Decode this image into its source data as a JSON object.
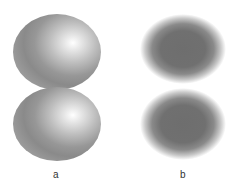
{
  "figure": {
    "panels": [
      {
        "label": "a",
        "description": "shaded spheres with specular highlight",
        "count": 2
      },
      {
        "label": "b",
        "description": "blurred dark ellipses without highlight",
        "count": 2
      }
    ],
    "colors": {
      "highlight": "#ffffff",
      "sphere_mid": "#bdbdbd",
      "sphere_edge": "#8a8a8a",
      "blur_core": "#6e6e6e",
      "background": "#ffffff"
    }
  }
}
